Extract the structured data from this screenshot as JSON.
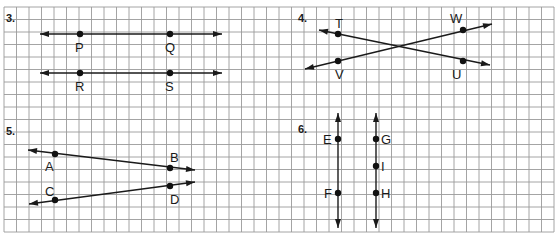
{
  "grid": {
    "x0": 4,
    "y0": 7,
    "cell": 12.5,
    "cols": 44,
    "rows": 18,
    "color": "#9a9a9a"
  },
  "colors": {
    "ink": "#1a1a1a",
    "background": "#ffffff"
  },
  "problems": [
    {
      "number": "3.",
      "number_pos": [
        6,
        22
      ],
      "lines": [
        {
          "name": "line-PQ",
          "from": [
            40,
            34
          ],
          "to": [
            222,
            34
          ],
          "arrows": "both"
        },
        {
          "name": "line-RS",
          "from": [
            40,
            73
          ],
          "to": [
            222,
            73
          ],
          "arrows": "both"
        }
      ],
      "points": [
        {
          "label": "P",
          "at": [
            80,
            34
          ],
          "label_pos": [
            75,
            52
          ]
        },
        {
          "label": "Q",
          "at": [
            170,
            34
          ],
          "label_pos": [
            165,
            52
          ]
        },
        {
          "label": "R",
          "at": [
            80,
            73
          ],
          "label_pos": [
            75,
            91
          ]
        },
        {
          "label": "S",
          "at": [
            170,
            73
          ],
          "label_pos": [
            165,
            91
          ]
        }
      ]
    },
    {
      "number": "4.",
      "number_pos": [
        298,
        22
      ],
      "lines": [
        {
          "name": "line-TU",
          "from": [
            319,
            30
          ],
          "to": [
            490,
            65
          ],
          "arrows": "both"
        },
        {
          "name": "line-VW",
          "from": [
            305,
            69
          ],
          "to": [
            492,
            24
          ],
          "arrows": "both"
        }
      ],
      "points": [
        {
          "label": "T",
          "at": [
            338,
            34
          ],
          "label_pos": [
            335,
            28
          ]
        },
        {
          "label": "W",
          "at": [
            463,
            30
          ],
          "label_pos": [
            450,
            23
          ]
        },
        {
          "label": "V",
          "at": [
            338,
            61
          ],
          "label_pos": [
            335,
            79
          ]
        },
        {
          "label": "U",
          "at": [
            463,
            61
          ],
          "label_pos": [
            452,
            79
          ]
        }
      ]
    },
    {
      "number": "5.",
      "number_pos": [
        6,
        135
      ],
      "lines": [
        {
          "name": "line-AB",
          "from": [
            28,
            150
          ],
          "to": [
            195,
            170
          ],
          "arrows": "both"
        },
        {
          "name": "line-CD",
          "from": [
            29,
            204
          ],
          "to": [
            195,
            182
          ],
          "arrows": "both"
        }
      ],
      "points": [
        {
          "label": "A",
          "at": [
            55,
            154
          ],
          "label_pos": [
            45,
            171
          ]
        },
        {
          "label": "B",
          "at": [
            170,
            168
          ],
          "label_pos": [
            170,
            162
          ]
        },
        {
          "label": "C",
          "at": [
            55,
            200
          ],
          "label_pos": [
            45,
            196
          ]
        },
        {
          "label": "D",
          "at": [
            170,
            186
          ],
          "label_pos": [
            170,
            204
          ]
        }
      ]
    },
    {
      "number": "6.",
      "number_pos": [
        298,
        133
      ],
      "lines": [
        {
          "name": "line-EF",
          "from": [
            338,
            113
          ],
          "to": [
            338,
            228
          ],
          "arrows": "both"
        },
        {
          "name": "line-GH",
          "from": [
            376,
            113
          ],
          "to": [
            376,
            228
          ],
          "arrows": "both"
        }
      ],
      "points": [
        {
          "label": "E",
          "at": [
            338,
            139
          ],
          "label_pos": [
            323,
            144
          ]
        },
        {
          "label": "F",
          "at": [
            338,
            193
          ],
          "label_pos": [
            324,
            198
          ]
        },
        {
          "label": "G",
          "at": [
            376,
            139
          ],
          "label_pos": [
            381,
            144
          ]
        },
        {
          "label": "I",
          "at": [
            376,
            166
          ],
          "label_pos": [
            381,
            171
          ]
        },
        {
          "label": "H",
          "at": [
            376,
            193
          ],
          "label_pos": [
            381,
            198
          ]
        }
      ]
    }
  ]
}
